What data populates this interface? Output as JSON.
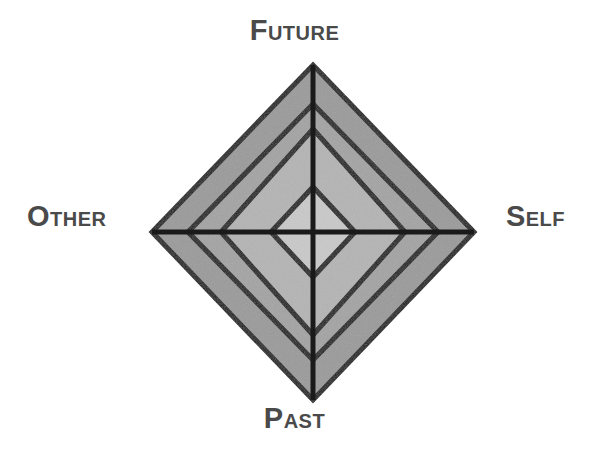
{
  "figure": {
    "title": "",
    "background_color": "#ffffff",
    "stroke_color": "#1a1a1a",
    "label_color": "#4a4a4a",
    "axis_labels": {
      "top": "Future",
      "right": "Self",
      "bottom": "Past",
      "left": "Other"
    }
  },
  "chart_data": {
    "type": "radar",
    "title": "",
    "subtitle": "",
    "xlabel": "",
    "ylabel": "",
    "grid": true,
    "legend_position": "none",
    "axes": [
      "Future",
      "Self",
      "Past",
      "Other"
    ],
    "axis_angles_deg": [
      90,
      0,
      270,
      180
    ],
    "rings": [
      {
        "level": 1,
        "label": "",
        "radius_fraction": 0.26,
        "fill": "#c9c9c9"
      },
      {
        "level": 2,
        "label": "",
        "radius_fraction": 0.58,
        "fill": "#b4b4b4"
      },
      {
        "level": 3,
        "label": "",
        "radius_fraction": 0.79,
        "fill": "#a3a3a3"
      },
      {
        "level": 4,
        "label": "",
        "radius_fraction": 1.0,
        "fill": "#9a9a9a"
      }
    ],
    "series": [
      {
        "name": "Outer boundary",
        "values": [
          1.0,
          1.0,
          1.0,
          1.0
        ]
      }
    ],
    "categories": [
      "Future",
      "Self",
      "Past",
      "Other"
    ],
    "values": [
      1.0,
      1.0,
      1.0,
      1.0
    ],
    "ylim": [
      0,
      1
    ],
    "geometry": {
      "center_x": 313,
      "center_y": 232,
      "radius_right": 161,
      "radius_left": 161,
      "radius_up": 167,
      "radius_down": 168,
      "ring_radii_right": [
        42,
        92,
        125,
        161
      ],
      "ring_radii_up": [
        45,
        103,
        128,
        167
      ],
      "ring_radii_down": [
        45,
        103,
        128,
        168
      ]
    },
    "colors": {
      "ring_1": "#c9c9c9",
      "ring_2": "#b4b4b4",
      "ring_3": "#a3a3a3",
      "ring_4": "#9a9a9a",
      "stroke": "#1a1a1a",
      "label": "#4a4a4a",
      "background": "#ffffff"
    }
  }
}
